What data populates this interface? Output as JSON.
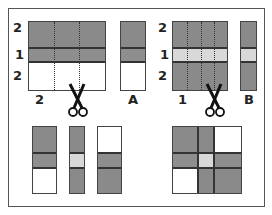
{
  "colors": {
    "dark": "#888888",
    "medium": "#8c8c8c",
    "light": "#d6d6d6",
    "white": "#ffffff",
    "line": "#333333"
  },
  "top_left": {
    "row_labels": [
      "2",
      "1",
      "2"
    ],
    "bottom_label": "2",
    "strip_label": "A"
  },
  "top_right": {
    "row_labels": [
      "2",
      "1",
      "2"
    ],
    "bottom_label": "1",
    "strip_label": "B"
  },
  "icons": {
    "scissors_top_left": "scissors-icon",
    "scissors_top_right": "scissors-icon"
  }
}
